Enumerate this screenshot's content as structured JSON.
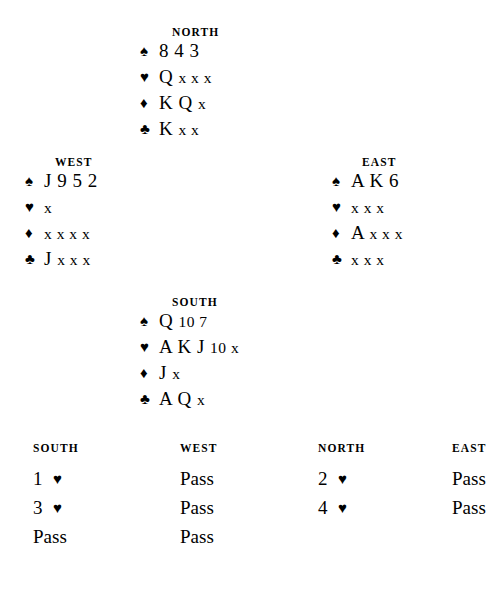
{
  "suits": {
    "spade": "♠",
    "heart": "♥",
    "diamond": "♦",
    "club": "♣"
  },
  "hands": {
    "north": {
      "label": "NORTH",
      "spades": "8 4 3",
      "hearts_high": "Q",
      "hearts_low": "x x x",
      "diamonds_high": "K Q",
      "diamonds_low": "x",
      "clubs_high": "K",
      "clubs_low": "x x"
    },
    "west": {
      "label": "WEST",
      "spades": "J 9 5 2",
      "hearts_low": "x",
      "diamonds_low": "x x x x",
      "clubs_high": "J",
      "clubs_low": "x x x"
    },
    "east": {
      "label": "EAST",
      "spades": "A K 6",
      "hearts_low": "x x x",
      "diamonds_high": "A",
      "diamonds_low": "x x x",
      "clubs_low": "x x x"
    },
    "south": {
      "label": "SOUTH",
      "spades_high": "Q",
      "spades_low": "10 7",
      "hearts_high": "A K J",
      "hearts_low": "10 x",
      "diamonds_high": "J",
      "diamonds_low": "x",
      "clubs_high": "A Q",
      "clubs_low": "x"
    }
  },
  "auction": {
    "headers": [
      "SOUTH",
      "WEST",
      "NORTH",
      "EAST"
    ],
    "rows": [
      [
        {
          "level": "1",
          "suit": "♥"
        },
        {
          "call": "Pass"
        },
        {
          "level": "2",
          "suit": "♥"
        },
        {
          "call": "Pass"
        }
      ],
      [
        {
          "level": "3",
          "suit": "♥"
        },
        {
          "call": "Pass"
        },
        {
          "level": "4",
          "suit": "♥"
        },
        {
          "call": "Pass"
        }
      ],
      [
        {
          "call": "Pass"
        },
        {
          "call": "Pass"
        },
        {
          "call": ""
        },
        {
          "call": ""
        }
      ]
    ]
  }
}
